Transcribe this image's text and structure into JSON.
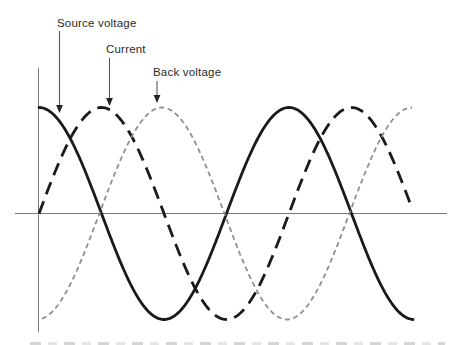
{
  "figure": {
    "background": "#ffffff",
    "annotations": [
      {
        "id": "source",
        "label": "Source voltage"
      },
      {
        "id": "current",
        "label": "Current"
      },
      {
        "id": "back",
        "label": "Back voltage"
      }
    ]
  },
  "chart_data": {
    "type": "line",
    "title": "",
    "xlabel": "",
    "ylabel": "",
    "x_unit": "electrical degrees",
    "x_range_deg": [
      0,
      539
    ],
    "ylim": [
      -1,
      1
    ],
    "grid": false,
    "legend_position": "inline arrow annotations above curves",
    "axes": {
      "x_axis": "horizontal zero line, no ticks or labels",
      "y_axis": "vertical line at origin, no ticks or labels"
    },
    "series": [
      {
        "id": "source",
        "name": "Source voltage",
        "waveform": "sinusoid",
        "amplitude": 1,
        "phase_deg": 0,
        "line_style": "solid",
        "color": "#1a1a1a",
        "description": "cosine wave starting at positive peak at the origin"
      },
      {
        "id": "current",
        "name": "Current",
        "waveform": "sinusoid",
        "amplitude": 1,
        "phase_deg": -90,
        "line_style": "long-dash",
        "color": "#1a1a1a",
        "description": "lags source voltage by 90 degrees (zero rising at origin)"
      },
      {
        "id": "back",
        "name": "Back voltage",
        "waveform": "sinusoid",
        "amplitude": 1,
        "phase_deg": -177,
        "line_style": "short-dash",
        "color": "#8f8f8f",
        "description": "approximately 180 degrees out of phase with source voltage (starts near negative peak)"
      }
    ],
    "samples_deg": {
      "x": [
        0,
        45,
        90,
        135,
        180,
        225,
        270,
        315,
        360,
        405,
        450,
        495,
        540
      ],
      "source_voltage": [
        1,
        0.71,
        0,
        -0.71,
        -1,
        -0.71,
        0,
        0.71,
        1,
        0.71,
        0,
        -0.71,
        -1
      ],
      "current": [
        0,
        0.71,
        1,
        0.71,
        0,
        -0.71,
        -1,
        -0.71,
        0,
        0.71,
        1,
        0.71,
        0
      ],
      "back_voltage": [
        -1,
        -0.71,
        0,
        0.71,
        1,
        0.71,
        0,
        -0.71,
        -1,
        -0.71,
        0,
        0.71,
        1
      ]
    },
    "style_colors": {
      "wave_black": "#1a1a1a",
      "wave_gray": "#8f8f8f",
      "axis_gray": "#7a7a7a",
      "annotation_arrow": "#555555",
      "label_text": "#2a2a2a"
    }
  }
}
